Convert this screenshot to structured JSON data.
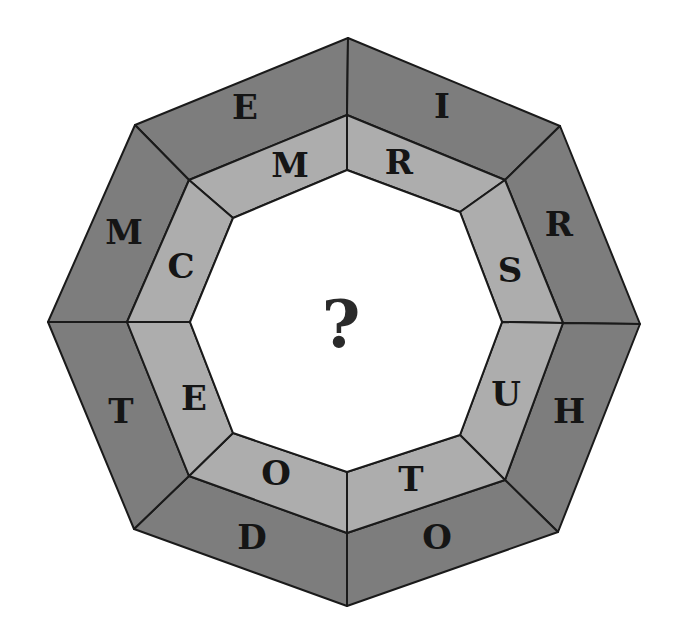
{
  "puzzle": {
    "center_label": "?",
    "outer_ring": [
      {
        "position": "top-left",
        "letter": "E"
      },
      {
        "position": "top-right",
        "letter": "I"
      },
      {
        "position": "right-upper",
        "letter": "R"
      },
      {
        "position": "right-lower",
        "letter": "H"
      },
      {
        "position": "bottom-right",
        "letter": "O"
      },
      {
        "position": "bottom-left",
        "letter": "D"
      },
      {
        "position": "left-lower",
        "letter": "T"
      },
      {
        "position": "left-upper",
        "letter": "M"
      }
    ],
    "inner_ring": [
      {
        "position": "top-left",
        "letter": "M"
      },
      {
        "position": "top-right",
        "letter": "R"
      },
      {
        "position": "right-upper",
        "letter": "S"
      },
      {
        "position": "right-lower",
        "letter": "U"
      },
      {
        "position": "bottom-right",
        "letter": "T"
      },
      {
        "position": "bottom-left",
        "letter": "O"
      },
      {
        "position": "left-lower",
        "letter": "E"
      },
      {
        "position": "left-upper",
        "letter": "C"
      }
    ],
    "colors": {
      "outer_segment": "#7d7d7d",
      "inner_segment": "#adadad",
      "center": "#ffffff",
      "outline": "#1a1a1a"
    }
  }
}
